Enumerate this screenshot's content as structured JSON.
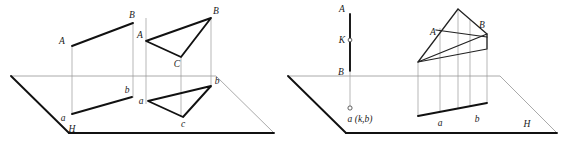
{
  "figure": {
    "colors": {
      "ink": "#111111",
      "thin_line": "#8e8e8e",
      "background": "#ffffff"
    },
    "panels": [
      {
        "id": "left-panel",
        "plane_label": "H",
        "labels": {
          "quad_top_left": "A",
          "quad_top_right": "B",
          "quad_bottom_left": "a",
          "quad_bottom_right": "b",
          "tri_A": "A",
          "tri_B": "B",
          "tri_C": "C",
          "proj_a": "a",
          "proj_b": "b",
          "proj_c": "c"
        }
      },
      {
        "id": "right-panel",
        "plane_label": "H",
        "labels": {
          "line_A": "A",
          "line_K": "K",
          "line_B": "B",
          "point_projection": "a (k,b)",
          "tri_A": "A",
          "tri_B": "B",
          "proj_a": "a",
          "proj_b": "b"
        }
      }
    ]
  }
}
